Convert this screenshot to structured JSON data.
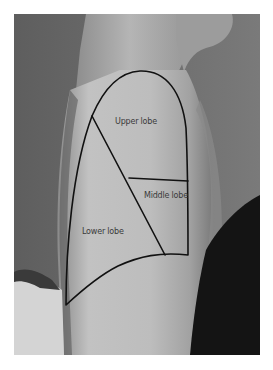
{
  "figure": {
    "labels": {
      "upper": "Upper lobe",
      "middle": "Middle lobe",
      "lower": "Lower lobe"
    },
    "colors": {
      "outline": "#111111",
      "background_wall": "#6a6a6a",
      "skin": "#b9b9b9",
      "dark_clothing": "#141414",
      "label_text": "#3a3a3a"
    }
  }
}
